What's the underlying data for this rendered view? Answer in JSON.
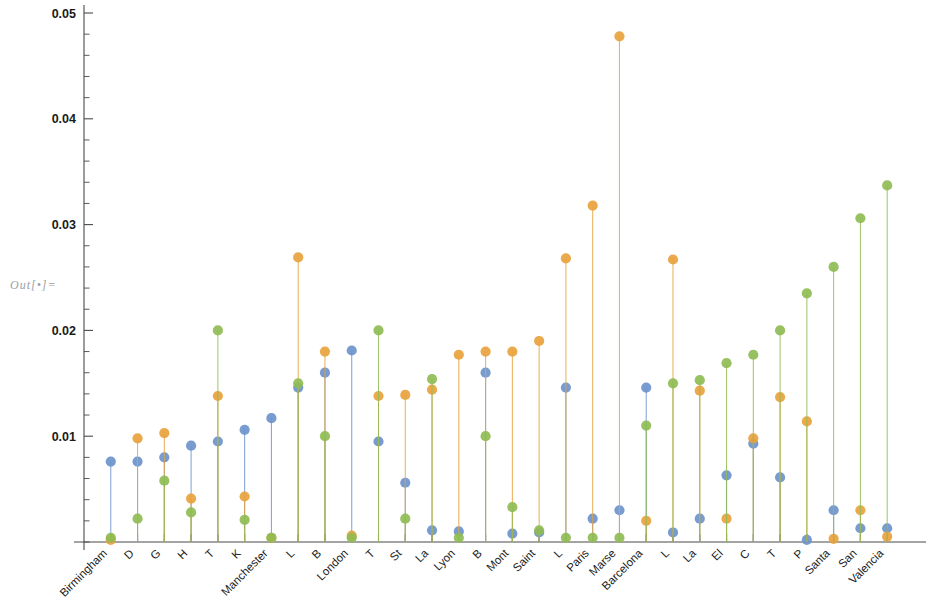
{
  "out_label": "Out[•]=",
  "chart_data": {
    "type": "scatter",
    "title": "",
    "subtitle": "",
    "xlabel": "",
    "ylabel": "",
    "ylim": [
      0,
      0.05
    ],
    "xlim": [
      0,
      30
    ],
    "grid": false,
    "legend": false,
    "legend_position": "none",
    "y_ticks": [
      0.05,
      0.04,
      0.03,
      0.02,
      0.01
    ],
    "y_tick_labels": [
      "0.05",
      "0.04",
      "0.03",
      "0.02",
      "0.01"
    ],
    "y_minor_ticks_per_major": 5,
    "categories": [
      "Birmingham",
      "D",
      "G",
      "H",
      "T",
      "K",
      "Manchester",
      "L",
      "B",
      "London",
      "T",
      "St",
      "La",
      "Lyon",
      "B",
      "Mont",
      "Saint",
      "L",
      "Paris",
      "Marse",
      "Barcelona",
      "L",
      "La",
      "El",
      "C",
      "T",
      "P",
      "Santa",
      "San",
      "Valencia"
    ],
    "series": [
      {
        "name": "blue-series",
        "color": "#6d93cc",
        "values": [
          0.0076,
          0.0076,
          0.008,
          0.0091,
          0.0095,
          0.0106,
          0.0117,
          0.0146,
          0.016,
          0.0181,
          0.0095,
          0.0056,
          0.0011,
          0.001,
          0.016,
          0.0008,
          0.0009,
          0.0146,
          0.0022,
          0.003,
          0.0146,
          0.0009,
          0.0022,
          0.0063,
          0.0093,
          0.0061,
          0.0002,
          0.003,
          0.0013,
          0.0013
        ]
      },
      {
        "name": "orange-series",
        "color": "#e8a33d",
        "values": [
          0.0002,
          0.0098,
          0.0103,
          0.0041,
          0.0138,
          0.0043,
          0.0004,
          0.0269,
          0.018,
          0.0006,
          0.0138,
          0.0139,
          0.0144,
          0.0177,
          0.018,
          0.018,
          0.019,
          0.0268,
          0.0318,
          0.0478,
          0.002,
          0.0267,
          0.0143,
          0.0022,
          0.0098,
          0.0137,
          0.0114,
          0.0003,
          0.003,
          0.0005
        ]
      },
      {
        "name": "green-series",
        "color": "#8fbc54",
        "values": [
          0.0004,
          0.0022,
          0.0058,
          0.0028,
          0.02,
          0.0021,
          0.0004,
          0.015,
          0.01,
          0.0004,
          0.02,
          0.0022,
          0.0154,
          0.0004,
          0.01,
          0.0033,
          0.0011,
          0.0004,
          0.0004,
          0.0004,
          0.011,
          0.015,
          0.0153,
          0.0169,
          0.0177,
          0.02,
          0.0235,
          0.026,
          0.0306,
          0.0337
        ]
      }
    ]
  }
}
